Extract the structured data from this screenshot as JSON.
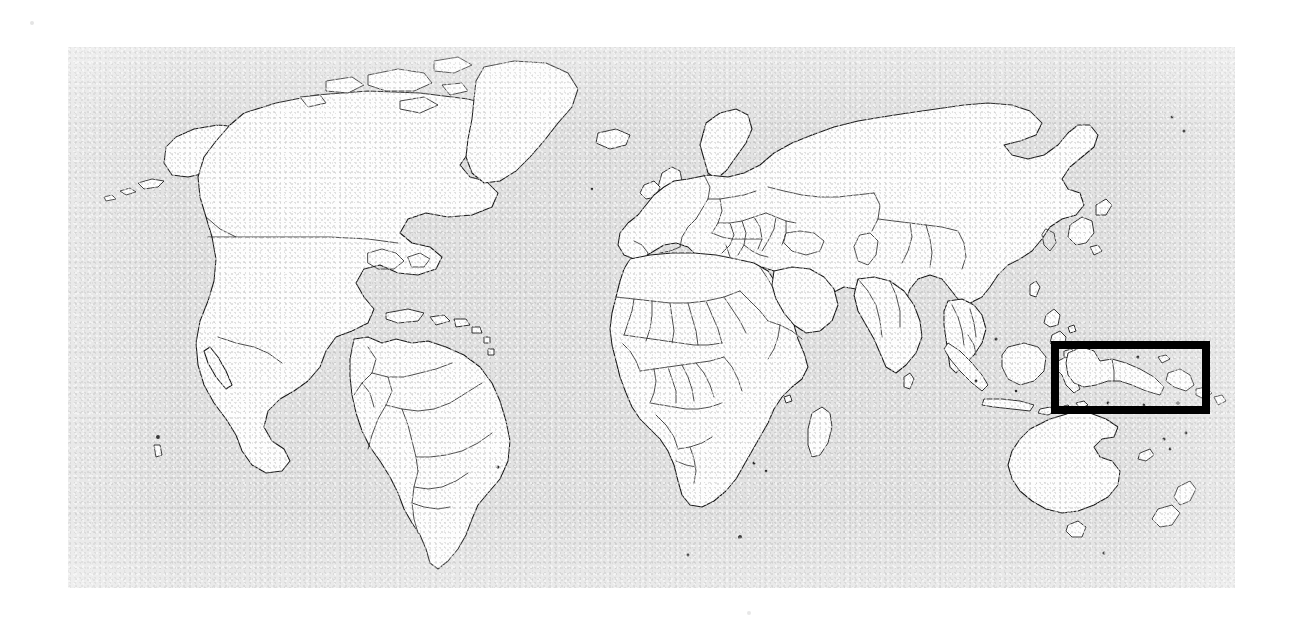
{
  "figure": {
    "canvas": {
      "width": 1292,
      "height": 627,
      "background": "#ffffff"
    }
  },
  "map_panel": {
    "name": "world-map-plate",
    "x": 68,
    "y": 47,
    "width": 1167,
    "height": 541,
    "ocean_color": "#e2e2e2",
    "land_color": "#fdfdfd",
    "border_color": "#1a1a1a",
    "texture": "photocopy-grain"
  },
  "highlight": {
    "label": "",
    "shape": "rectangle",
    "region": "New Guinea / Papua",
    "stroke_color": "#000000",
    "stroke_width_px": 8,
    "x": 1051,
    "y": 341,
    "width": 159,
    "height": 73,
    "fill": "transparent"
  },
  "regions": [
    {
      "name": "North America",
      "features": [
        "Canada",
        "United States",
        "Mexico",
        "Greenland",
        "Alaska"
      ]
    },
    {
      "name": "South America",
      "features": [
        "Brazil",
        "Argentina",
        "Chile",
        "Peru",
        "Colombia",
        "Venezuela",
        "Bolivia"
      ]
    },
    {
      "name": "Europe",
      "features": [
        "Iceland",
        "British Isles",
        "Scandinavia",
        "Iberia",
        "Italy",
        "Balkans"
      ]
    },
    {
      "name": "Africa",
      "features": [
        "Sahara states",
        "West Africa",
        "Horn of Africa",
        "Southern Africa",
        "Madagascar"
      ]
    },
    {
      "name": "Asia",
      "features": [
        "Russia",
        "China",
        "India",
        "Middle East",
        "Japan",
        "Korea",
        "Southeast Asia"
      ]
    },
    {
      "name": "Oceania",
      "features": [
        "Australia",
        "New Guinea",
        "New Zealand",
        "Tasmania",
        "Indonesian archipelago"
      ]
    }
  ],
  "annotations": {
    "legend": "",
    "caption": "",
    "scale": "",
    "graticule": "none"
  }
}
